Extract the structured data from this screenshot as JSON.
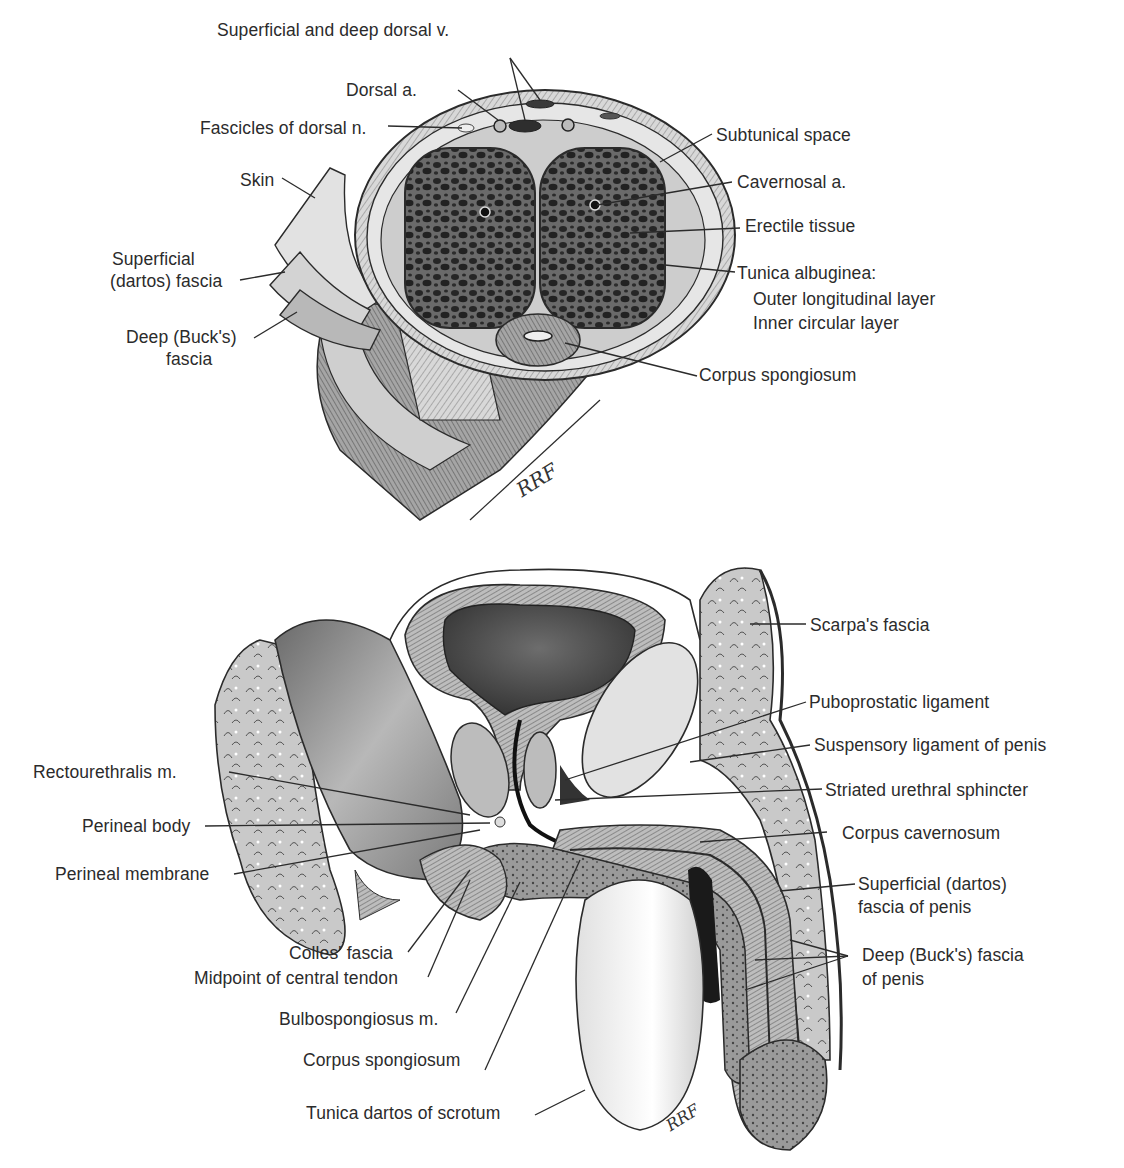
{
  "figures": {
    "cross_section": {
      "title": "Transverse section of penile shaft",
      "signature": "RRF",
      "labels": {
        "sup_deep_dorsal_v": "Superficial and deep dorsal v.",
        "dorsal_a": "Dorsal a.",
        "fascicles_dorsal_n": "Fascicles of dorsal n.",
        "skin": "Skin",
        "superficial_dartos_1": "Superficial",
        "superficial_dartos_2": "(dartos) fascia",
        "deep_bucks_1": "Deep (Buck's)",
        "deep_bucks_2": "fascia",
        "subtunical_space": "Subtunical space",
        "cavernosal_a": "Cavernosal a.",
        "erectile_tissue": "Erectile tissue",
        "tunica_albuginea": "Tunica albuginea:",
        "outer_layer": "Outer longitudinal layer",
        "inner_layer": "Inner circular layer",
        "corpus_spongiosum": "Corpus spongiosum"
      }
    },
    "sagittal_section": {
      "title": "Sagittal section of male pelvis and penis",
      "signature": "RRF",
      "labels": {
        "scarpas_fascia": "Scarpa's fascia",
        "puboprostatic_ligament": "Puboprostatic ligament",
        "suspensory_ligament": "Suspensory ligament of penis",
        "striated_urethral_sphincter": "Striated urethral sphincter",
        "corpus_cavernosum": "Corpus cavernosum",
        "superficial_dartos_penis_1": "Superficial (dartos)",
        "superficial_dartos_penis_2": "fascia of penis",
        "deep_bucks_penis_1": "Deep (Buck's) fascia",
        "deep_bucks_penis_2": "of penis",
        "rectourethralis": "Rectourethralis m.",
        "perineal_body": "Perineal body",
        "perineal_membrane": "Perineal membrane",
        "colles_fascia": "Colles' fascia",
        "central_tendon": "Midpoint of central tendon",
        "bulbospongiosus": "Bulbospongiosus m.",
        "corpus_spongiosum": "Corpus spongiosum",
        "tunica_dartos_scrotum": "Tunica dartos of scrotum"
      }
    }
  },
  "colors": {
    "ink": "#2b2b2b",
    "tissue_light": "#d9d9d9",
    "tissue_mid": "#a8a8a8",
    "tissue_dark": "#3a3a3a",
    "background": "#ffffff"
  }
}
